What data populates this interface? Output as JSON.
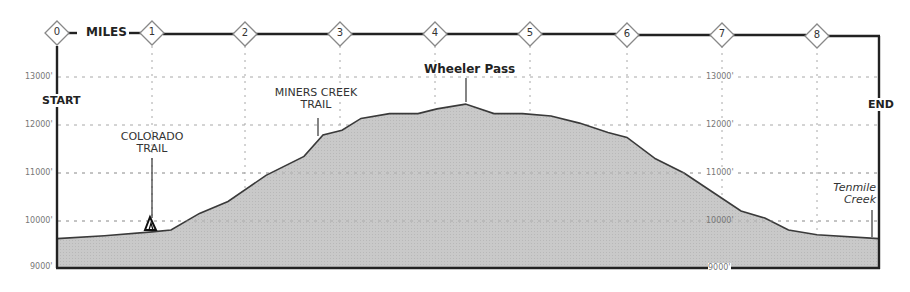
{
  "chart_data": {
    "type": "area",
    "xlabel": "MILES",
    "ylabel": "Elevation (ft)",
    "x_ticks": [
      "0",
      "1",
      "2",
      "3",
      "4",
      "5",
      "6",
      "7",
      "8"
    ],
    "y_ticks": [
      "9000'",
      "10000'",
      "11000'",
      "12000'",
      "13000'"
    ],
    "ylim": [
      9000,
      13500
    ],
    "xlim": [
      0,
      8.65
    ],
    "grid": true,
    "x": [
      0,
      0.5,
      1.0,
      1.2,
      1.5,
      1.8,
      2.2,
      2.6,
      2.8,
      3.0,
      3.2,
      3.5,
      3.8,
      4.0,
      4.3,
      4.6,
      4.9,
      5.2,
      5.5,
      5.8,
      6.0,
      6.3,
      6.6,
      6.9,
      7.2,
      7.45,
      7.7,
      8.0,
      8.65
    ],
    "elevation": [
      9620,
      9680,
      9760,
      9800,
      10150,
      10400,
      10950,
      11350,
      11800,
      11900,
      12150,
      12250,
      12250,
      12350,
      12450,
      12250,
      12250,
      12200,
      12050,
      11850,
      11750,
      11300,
      11000,
      10600,
      10200,
      10050,
      9800,
      9700,
      9620
    ],
    "annotations": [
      {
        "label": "START",
        "x": 0
      },
      {
        "label": "COLORADO TRAIL",
        "x": 1.0,
        "elevation": 9760
      },
      {
        "label": "MINERS CREEK TRAIL",
        "x": 2.75,
        "elevation": 11780
      },
      {
        "label": "Wheeler Pass",
        "x": 4.3,
        "elevation": 12450
      },
      {
        "label": "Tenmile Creek",
        "x": 8.6,
        "elevation": 9620
      },
      {
        "label": "END",
        "x": 8.65
      }
    ]
  },
  "labels": {
    "miles": "MILES",
    "start": "START",
    "end": "END",
    "colorado_trail": [
      "COLORADO",
      "TRAIL"
    ],
    "miners_creek": [
      "MINERS CREEK",
      "TRAIL"
    ],
    "wheeler_pass": "Wheeler Pass",
    "tenmile_creek": [
      "Tenmile",
      "Creek"
    ],
    "left_ticks": [
      "13000'",
      "12000'",
      "11000'",
      "10000'",
      "9000'"
    ],
    "right_ticks": [
      "13000'",
      "12000'",
      "11000'",
      "10000'",
      "9000'"
    ],
    "mile_markers": [
      "0",
      "1",
      "2",
      "3",
      "4",
      "5",
      "6",
      "7",
      "8"
    ]
  },
  "colors": {
    "fill": "#c4c4c4",
    "line": "#3a3a3a",
    "frame": "#222222",
    "grid": "#a8a8a8"
  }
}
